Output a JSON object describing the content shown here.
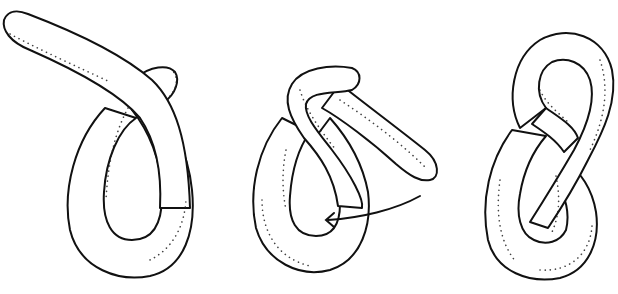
{
  "figure": {
    "stages": [
      {
        "id": "stage-1",
        "label": "loop"
      },
      {
        "id": "stage-2",
        "label": "wrap-and-tuck",
        "arrow": "tuck end through loop"
      },
      {
        "id": "stage-3",
        "label": "figure-eight"
      }
    ],
    "colors": {
      "stroke": "#111111",
      "fill": "#ffffff",
      "stipple": "#222222"
    }
  }
}
